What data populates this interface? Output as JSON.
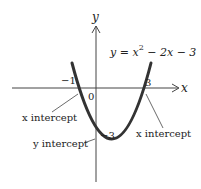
{
  "equation": "y = x² − 2x − 3",
  "equation_parts": {
    "lhs": "y = x",
    "sup": "2",
    "rhs": " − 2x − 3"
  },
  "axes": {
    "x_label": "x",
    "y_label": "y",
    "origin_label": "0"
  },
  "ticks": {
    "neg_one": "−1",
    "three": "3",
    "neg_three": "−3"
  },
  "annotations": {
    "x_intercept_left": "x intercept",
    "x_intercept_right": "x intercept",
    "y_intercept": "y intercept"
  },
  "colors": {
    "curve": "#333333",
    "axis": "#444444",
    "text": "#222222"
  }
}
